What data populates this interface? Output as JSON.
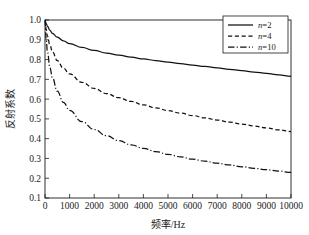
{
  "chart_data": {
    "type": "line",
    "title": "",
    "xlabel": "频率/Hz",
    "ylabel": "反射系数",
    "xlim": [
      0,
      10000
    ],
    "ylim": [
      0.1,
      1.0
    ],
    "grid": false,
    "legend_position": "top-right",
    "xticks": [
      0,
      1000,
      2000,
      3000,
      4000,
      5000,
      6000,
      7000,
      8000,
      9000,
      10000
    ],
    "xtick_labels": [
      "0",
      "1000",
      "2000",
      "3000",
      "4000",
      "5000",
      "6000",
      "7000",
      "8000",
      "9000",
      "10000"
    ],
    "yticks": [
      0.1,
      0.2,
      0.3,
      0.4,
      0.5,
      0.6,
      0.7,
      0.8,
      0.9,
      1.0
    ],
    "ytick_labels": [
      "0.1",
      "0.2",
      "0.3",
      "0.4",
      "0.5",
      "0.6",
      "0.7",
      "0.8",
      "0.9",
      "1.0"
    ],
    "x": [
      0,
      50,
      100,
      200,
      300,
      500,
      750,
      1000,
      1500,
      2000,
      2500,
      3000,
      3500,
      4000,
      4500,
      5000,
      5500,
      6000,
      6500,
      7000,
      7500,
      8000,
      8500,
      9000,
      9500,
      10000
    ],
    "series": [
      {
        "name": "n=2",
        "label": "n=2",
        "style": "solid",
        "color": "#111111",
        "values": [
          1.0,
          0.982,
          0.968,
          0.948,
          0.933,
          0.913,
          0.895,
          0.881,
          0.861,
          0.846,
          0.833,
          0.822,
          0.812,
          0.803,
          0.795,
          0.787,
          0.779,
          0.772,
          0.765,
          0.758,
          0.751,
          0.744,
          0.737,
          0.73,
          0.723,
          0.715
        ]
      },
      {
        "name": "n=4",
        "label": "n=4",
        "style": "dashed",
        "color": "#111111",
        "values": [
          1.0,
          0.952,
          0.918,
          0.872,
          0.84,
          0.795,
          0.756,
          0.727,
          0.685,
          0.654,
          0.628,
          0.607,
          0.588,
          0.571,
          0.556,
          0.542,
          0.529,
          0.517,
          0.505,
          0.494,
          0.484,
          0.474,
          0.464,
          0.454,
          0.445,
          0.436
        ]
      },
      {
        "name": "n=10",
        "label": "n=10",
        "style": "dashdot",
        "color": "#111111",
        "values": [
          1.0,
          0.9,
          0.838,
          0.76,
          0.709,
          0.64,
          0.583,
          0.543,
          0.486,
          0.446,
          0.415,
          0.39,
          0.369,
          0.351,
          0.335,
          0.321,
          0.308,
          0.296,
          0.286,
          0.276,
          0.267,
          0.258,
          0.25,
          0.243,
          0.236,
          0.229
        ]
      }
    ]
  },
  "legend": {
    "entries": [
      {
        "label": "n=2",
        "style": "solid"
      },
      {
        "label": "n=4",
        "style": "dashed"
      },
      {
        "label": "n=10",
        "style": "dashdot"
      }
    ]
  },
  "axes": {
    "x_label": "频率/Hz",
    "y_label": "反射系数"
  }
}
